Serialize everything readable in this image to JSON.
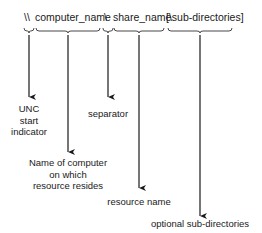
{
  "syntax": {
    "unc_prefix": "\\\\",
    "computer_name": "computer_name",
    "separator": "\\",
    "share_name": "share_name",
    "sub_directories": "[\\sub-directories]"
  },
  "annotations": {
    "unc_start": [
      "UNC",
      "start",
      "indicator"
    ],
    "computer": [
      "Name of computer",
      "on which",
      "resource resides"
    ],
    "separator": "separator",
    "resource": "resource name",
    "subdirs": "optional sub-directories"
  },
  "colors": {
    "line": "#1a1a1a",
    "background": "#ffffff"
  }
}
